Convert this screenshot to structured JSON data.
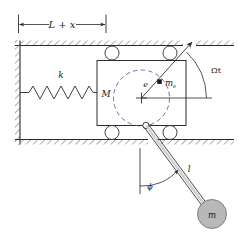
{
  "figure": {
    "background_color": "#ffffff",
    "line_color": "#2b2b2b",
    "hatch_color": "#9a9a9a",
    "pendulum_bob_fill": "#b8b8b8",
    "eccentric_dot_fill": "#1a1a1a"
  },
  "labels": {
    "dimension": "L + x",
    "spring_stiffness": "k",
    "block_mass": "M",
    "eccentricity": "e",
    "eccentric_mass": "m",
    "eccentric_mass_sub": "e",
    "rotation_angle": "Ωt",
    "pendulum_length": "l",
    "pendulum_angle": "ϕ",
    "pendulum_mass": "m"
  },
  "elements": {
    "left_wall": "hatched-vertical-wall",
    "top_wall": "hatched-horizontal-wall",
    "bottom_wall": "hatched-horizontal-wall",
    "spring": "coil-spring",
    "block": "rectangular-cart",
    "rollers": "four-rollers",
    "eccentric_path": "dashed-circle",
    "block_center": "cross-marker",
    "radius_line": "rotating-radius-arrow",
    "angle_arc": "omega-t-arc",
    "reference_line": "horizontal-datum-line",
    "pendulum_pivot": "small-circle-pivot",
    "pendulum_rod": "double-line-rod",
    "pendulum_bob": "filled-circle-mass",
    "phi_arc": "phi-angle-arc",
    "vertical_reference": "vertical-dashed-datum",
    "dimension_line": "double-arrow-dimension"
  }
}
